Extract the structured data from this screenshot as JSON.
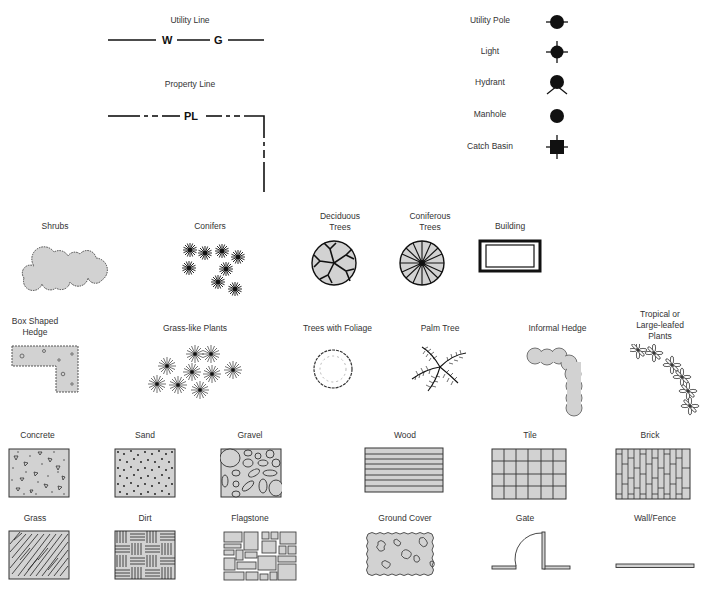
{
  "colors": {
    "fill": "#d2d2d2",
    "stroke": "#333333",
    "ink": "#111111"
  },
  "lines": {
    "utility_line": {
      "label": "Utility Line",
      "codes": [
        "W",
        "G"
      ]
    },
    "property_line": {
      "label": "Property Line",
      "code": "PL"
    }
  },
  "utilities": [
    {
      "label": "Utility Pole",
      "icon": "utility-pole-icon"
    },
    {
      "label": "Light",
      "icon": "light-icon"
    },
    {
      "label": "Hydrant",
      "icon": "hydrant-icon"
    },
    {
      "label": "Manhole",
      "icon": "manhole-icon"
    },
    {
      "label": "Catch Basin",
      "icon": "catch-basin-icon"
    }
  ],
  "plants_row1": [
    {
      "label": "Shrubs",
      "icon": "shrubs-icon"
    },
    {
      "label": "Conifers",
      "icon": "conifers-icon"
    },
    {
      "label": "Deciduous\nTrees",
      "icon": "deciduous-tree-icon"
    },
    {
      "label": "Coniferous\nTrees",
      "icon": "coniferous-tree-icon"
    },
    {
      "label": "Building",
      "icon": "building-icon"
    }
  ],
  "plants_row2": [
    {
      "label": "Box Shaped\nHedge",
      "icon": "box-hedge-icon"
    },
    {
      "label": "Grass-like Plants",
      "icon": "grass-like-plants-icon"
    },
    {
      "label": "Trees with Foliage",
      "icon": "tree-foliage-icon"
    },
    {
      "label": "Palm Tree",
      "icon": "palm-tree-icon"
    },
    {
      "label": "Informal Hedge",
      "icon": "informal-hedge-icon"
    },
    {
      "label": "Tropical or\nLarge-leafed\nPlants",
      "icon": "tropical-plants-icon"
    }
  ],
  "materials_row1": [
    {
      "label": "Concrete",
      "icon": "concrete-icon"
    },
    {
      "label": "Sand",
      "icon": "sand-icon"
    },
    {
      "label": "Gravel",
      "icon": "gravel-icon"
    },
    {
      "label": "Wood",
      "icon": "wood-icon"
    },
    {
      "label": "Tile",
      "icon": "tile-icon"
    },
    {
      "label": "Brick",
      "icon": "brick-icon"
    }
  ],
  "materials_row2": [
    {
      "label": "Grass",
      "icon": "grass-icon"
    },
    {
      "label": "Dirt",
      "icon": "dirt-icon"
    },
    {
      "label": "Flagstone",
      "icon": "flagstone-icon"
    },
    {
      "label": "Ground Cover",
      "icon": "ground-cover-icon"
    },
    {
      "label": "Gate",
      "icon": "gate-icon"
    },
    {
      "label": "Wall/Fence",
      "icon": "wall-fence-icon"
    }
  ]
}
